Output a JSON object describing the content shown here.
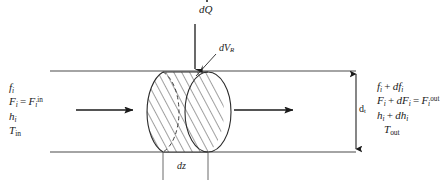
{
  "figure": {
    "name": "differential-control-volume-in-tubular-reactor",
    "heat_input": {
      "symbol_d": "d",
      "symbol_q": "Q",
      "has_overdot": true,
      "label_plain": "dQ̇"
    },
    "volume_element": {
      "symbol_d": "d",
      "symbol_v": "V",
      "subscript": "R",
      "label_plain": "dV_R"
    },
    "axial_length": {
      "label_plain": "dz",
      "symbol_d": "d",
      "symbol_z": "z"
    },
    "tube_diameter": {
      "label_plain": "d_t",
      "symbol": "d",
      "subscript": "t"
    },
    "inlet_state": {
      "lines_plain": [
        "f_i",
        "F_i = F_i^in",
        "h_i",
        "T_in"
      ],
      "line1": {
        "var": "f",
        "sub": "i"
      },
      "line2": {
        "var1": "F",
        "sub1": "i",
        "eq": "=",
        "var2": "F",
        "sub2": "i",
        "sup2": "in"
      },
      "line3": {
        "var": "h",
        "sub": "i"
      },
      "line4": {
        "var": "T",
        "sub": "in"
      }
    },
    "outlet_state": {
      "lines_plain": [
        "f_i + df_i",
        "F_i + dF_i = F_i^out",
        "h_i + dh_i",
        "T_out"
      ],
      "line1": {
        "var": "f",
        "sub": "i",
        "plus": "+",
        "dvar": "df",
        "dsub": "i"
      },
      "line2": {
        "var1": "F",
        "sub1": "i",
        "plus": "+",
        "dvar": "dF",
        "dsub": "i",
        "eq": "=",
        "var2": "F",
        "sub2": "i",
        "sup2": "out"
      },
      "line3": {
        "var": "h",
        "sub": "i",
        "plus": "+",
        "dvar": "dh",
        "dsub": "i"
      },
      "line4": {
        "var": "T",
        "sub": "out"
      }
    },
    "flow_arrows": {
      "inlet_arrow": "flow-arrow-right",
      "outlet_arrow": "flow-arrow-right"
    },
    "colors": {
      "line": "#2b2b2b",
      "wall": "#4a4a4a",
      "hatch": "#2b2b2b",
      "text": "#1a1a1a",
      "background": "#ffffff"
    }
  }
}
